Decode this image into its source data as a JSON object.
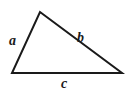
{
  "diagram": {
    "type": "geometric-figure",
    "figure_name": "triangle",
    "background_color": "#ffffff",
    "stroke_color": "#1a1a1a",
    "stroke_width": 2,
    "canvas": {
      "width": 129,
      "height": 93
    },
    "vertices": [
      {
        "name": "apex",
        "x": 40,
        "y": 12
      },
      {
        "name": "bottom-left",
        "x": 12,
        "y": 73
      },
      {
        "name": "bottom-right",
        "x": 122,
        "y": 73
      }
    ],
    "polygon_points": "40,12 122,73 12,73",
    "sides": [
      {
        "label": "a",
        "role": "left-side",
        "from": "bottom-left",
        "to": "apex",
        "label_position": {
          "x": 9,
          "y": 34
        }
      },
      {
        "label": "b",
        "role": "right-side",
        "from": "apex",
        "to": "bottom-right",
        "label_position": {
          "x": 77,
          "y": 31
        }
      },
      {
        "label": "c",
        "role": "base",
        "from": "bottom-left",
        "to": "bottom-right",
        "label_position": {
          "x": 61,
          "y": 77
        }
      }
    ]
  }
}
